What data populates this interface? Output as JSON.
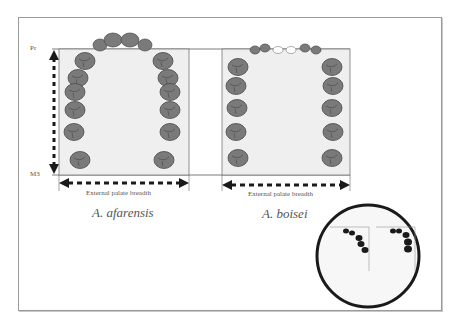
{
  "figure": {
    "measurements": {
      "top_landmark": "Pr",
      "bottom_landmark": "M3",
      "breadth_label": "External palate breadth"
    },
    "panels": [
      {
        "species": "A. afarensis",
        "breadth_label": "External palate breadth"
      },
      {
        "species": "A. boisei",
        "breadth_label": "External palate breadth"
      }
    ],
    "inset": {
      "description": "circular inset showing two tooth-row outlines in corners"
    },
    "colors": {
      "tooth_fill": "#7a7a7a",
      "tooth_stroke": "#4a4a4a",
      "palate_fill": "#efefef",
      "arrow": "#1a1a1a",
      "frame": "#9a9a9a"
    }
  }
}
